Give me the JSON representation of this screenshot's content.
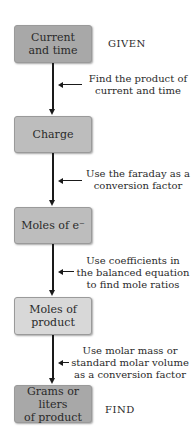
{
  "diagram": {
    "type": "flowchart",
    "direction": "top-to-bottom",
    "nodes": [
      {
        "id": "n1",
        "label": "Current and time",
        "line1": "Current",
        "line2": "and time",
        "shade": "dark"
      },
      {
        "id": "n2",
        "label": "Charge",
        "line1": "Charge",
        "line2": "",
        "shade": "mid"
      },
      {
        "id": "n3",
        "label": "Moles of e⁻",
        "line1": "Moles of e⁻",
        "line2": "",
        "shade": "mid"
      },
      {
        "id": "n4",
        "label": "Moles of product",
        "line1": "Moles of",
        "line2": "product",
        "shade": "light"
      },
      {
        "id": "n5",
        "label": "Grams or liters of product",
        "line1": "Grams or liters",
        "line2": "of product",
        "shade": "dark"
      }
    ],
    "tags": {
      "given": "GIVEN",
      "find": "FIND"
    },
    "steps": [
      {
        "from": "n1",
        "to": "n2",
        "lines": [
          "Find the product of",
          "current and time"
        ]
      },
      {
        "from": "n2",
        "to": "n3",
        "lines": [
          "Use the faraday as a",
          "conversion factor"
        ]
      },
      {
        "from": "n3",
        "to": "n4",
        "lines": [
          "Use coefficients in",
          "the balanced equation",
          "to find mole ratios"
        ]
      },
      {
        "from": "n4",
        "to": "n5",
        "lines": [
          "Use molar mass or",
          "standard molar volume",
          "as a conversion factor"
        ]
      }
    ],
    "colors": {
      "box_dark": "#a8a8a8",
      "box_mid": "#bdbdbd",
      "box_light": "#d8d8d8",
      "arrow": "#1a1a1a"
    }
  }
}
